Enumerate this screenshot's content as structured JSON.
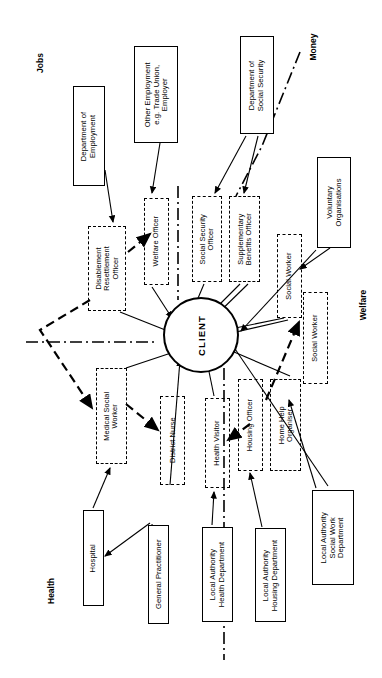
{
  "figure": {
    "center": {
      "label": "CLIENT"
    },
    "quadrants": [
      {
        "name": "jobs",
        "label": "Jobs",
        "x": 30,
        "y": 58
      },
      {
        "name": "money",
        "label": "Money",
        "x": 300,
        "y": 42
      },
      {
        "name": "welfare",
        "label": "Welfare",
        "x": 348,
        "y": 300
      },
      {
        "name": "health",
        "label": "Health",
        "x": 38,
        "y": 586
      }
    ],
    "agencies": [
      {
        "name": "department-of-employment",
        "label": "Department of\nEmployment",
        "x": 73,
        "y": 86,
        "w": 32,
        "h": 100,
        "fs": 7.6
      },
      {
        "name": "other-employment",
        "label": "Other Employment\ne.g. Trade Union,\nEmployer",
        "x": 134,
        "y": 46,
        "w": 44,
        "h": 97,
        "fs": 7.6
      },
      {
        "name": "department-of-social-security",
        "label": "Department of\nSocial Security",
        "x": 240,
        "y": 36,
        "w": 34,
        "h": 98,
        "fs": 7.6
      },
      {
        "name": "voluntary-organisations",
        "label": "Voluntary\nOrganisations",
        "x": 317,
        "y": 157,
        "w": 34,
        "h": 91,
        "fs": 7.6
      },
      {
        "name": "hospital",
        "label": "Hospital",
        "x": 83,
        "y": 510,
        "w": 21,
        "h": 96,
        "fs": 7.6
      },
      {
        "name": "general-practitioner",
        "label": "General Practitioner",
        "x": 148,
        "y": 525,
        "w": 21,
        "h": 99,
        "fs": 7.6
      },
      {
        "name": "local-authority-health-department",
        "label": "Local Authority\nHealth Department",
        "x": 202,
        "y": 527,
        "w": 31,
        "h": 95,
        "fs": 7.6
      },
      {
        "name": "local-authority-housing-department",
        "label": "Local Authority\nHousing Department",
        "x": 255,
        "y": 528,
        "w": 31,
        "h": 94,
        "fs": 7.6
      },
      {
        "name": "local-authority-social-work-department",
        "label": "Local Authority\nSocial Work\nDepartment",
        "x": 312,
        "y": 490,
        "w": 42,
        "h": 95,
        "fs": 7.6
      }
    ],
    "workers": [
      {
        "name": "disablement-resettlement-officer",
        "label": "Disablement\nResettlement\nOfficer",
        "x": 88,
        "y": 226,
        "w": 38,
        "h": 85,
        "fs": 7.4
      },
      {
        "name": "welfare-officer",
        "label": "Welfare Officer",
        "x": 144,
        "y": 198,
        "w": 25,
        "h": 87,
        "fs": 7.4
      },
      {
        "name": "social-security-officer",
        "label": "Social Security\nOfficer",
        "x": 192,
        "y": 196,
        "w": 30,
        "h": 86,
        "fs": 7.4
      },
      {
        "name": "supplementary-benefits-officer",
        "label": "Supplementary\nBenefits Officer",
        "x": 229,
        "y": 196,
        "w": 31,
        "h": 86,
        "fs": 7.4
      },
      {
        "name": "social-worker-upper",
        "label": "Social Worker",
        "x": 277,
        "y": 234,
        "w": 25,
        "h": 84,
        "fs": 7.4
      },
      {
        "name": "social-worker-lower",
        "label": "Social Worker",
        "x": 303,
        "y": 292,
        "w": 25,
        "h": 92,
        "fs": 7.4
      },
      {
        "name": "medical-social-worker",
        "label": "Medical Social\nWorker",
        "x": 96,
        "y": 368,
        "w": 31,
        "h": 96,
        "fs": 7.4
      },
      {
        "name": "district-nurse",
        "label": "District Nurse",
        "x": 160,
        "y": 396,
        "w": 25,
        "h": 89,
        "fs": 7.4
      },
      {
        "name": "health-visitor",
        "label": "Health Visitor",
        "x": 205,
        "y": 398,
        "w": 25,
        "h": 90,
        "fs": 7.4
      },
      {
        "name": "housing-officer",
        "label": "Housing Officer",
        "x": 238,
        "y": 379,
        "w": 25,
        "h": 92,
        "fs": 7.4
      },
      {
        "name": "home-help-organiser",
        "label": "Home Help\nOrganiser",
        "x": 270,
        "y": 379,
        "w": 31,
        "h": 92,
        "fs": 7.4
      }
    ],
    "edges": {
      "solid": [
        "M105,170 L113,222",
        "M160,143 L152,193",
        "M246,136 L215,193",
        "M258,136 L244,193",
        "M152,287 L172,318",
        "M204,284 L193,310",
        "M240,284 L202,322",
        "M248,284 L207,324",
        "M284,318 L216,332",
        "M288,320 L219,336",
        "M330,248 L300,269",
        "M316,250 L241,331",
        "M120,312 L183,337",
        "M126,368 L192,346",
        "M93,508 L110,468",
        "M152,524 L160,604",
        "M150,523 L105,556",
        "M170,485 L180,360",
        "M212,525 L214,492",
        "M262,527 L250,473",
        "M214,396 L205,352",
        "M290,376 L220,346",
        "M316,488 L289,400",
        "M328,486 L231,343"
      ],
      "thick_dashed": [
        "M128,252 L150,234",
        "M90,300 L40,330 L92,408",
        "M126,404 L158,430",
        "M266,400 L299,322",
        "M250,424 L228,440"
      ],
      "chain": [
        "M300,52 L262,146 L236,196",
        "M26,342 L156,342",
        "M178,186 L178,300",
        "M224,346 L224,660"
      ]
    }
  }
}
